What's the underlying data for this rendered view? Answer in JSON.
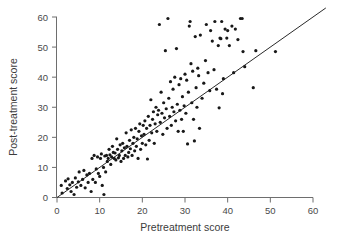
{
  "chart_data": {
    "type": "scatter",
    "title": "",
    "xlabel": "Pretreatment score",
    "ylabel": "Post-treatment score",
    "xlim": [
      0,
      60
    ],
    "ylim": [
      0,
      60
    ],
    "xticks": [
      0,
      10,
      20,
      30,
      40,
      50,
      60
    ],
    "yticks": [
      0,
      10,
      20,
      30,
      40,
      50,
      60
    ],
    "xtick_labels": [
      "0",
      "10",
      "20",
      "30",
      "40",
      "50",
      "60"
    ],
    "ytick_labels": [
      "0",
      "10",
      "20",
      "30",
      "40",
      "50",
      "60"
    ],
    "grid": false,
    "legend": null,
    "marker": "dot",
    "marker_color": "#181818",
    "marker_size": 1.6,
    "reference_line": {
      "name": "identity-line",
      "type": "line",
      "description": "y = x line of no change",
      "slope": 1,
      "intercept": 0,
      "x_start": 0,
      "y_start": 0,
      "x_end": 63,
      "y_end": 63,
      "color": "#2a2a2a"
    },
    "n_points": 176,
    "points": [
      [
        1.0,
        4.0
      ],
      [
        1.2,
        1.5
      ],
      [
        2.0,
        5.5
      ],
      [
        2.4,
        3.0
      ],
      [
        2.6,
        6.2
      ],
      [
        3.0,
        4.2
      ],
      [
        3.3,
        2.0
      ],
      [
        3.6,
        5.0
      ],
      [
        4.0,
        1.0
      ],
      [
        4.3,
        6.5
      ],
      [
        4.6,
        3.4
      ],
      [
        5.0,
        5.2
      ],
      [
        5.2,
        8.5
      ],
      [
        5.6,
        4.0
      ],
      [
        6.0,
        6.0
      ],
      [
        6.3,
        9.0
      ],
      [
        6.6,
        3.2
      ],
      [
        7.0,
        7.5
      ],
      [
        7.3,
        5.0
      ],
      [
        7.6,
        8.0
      ],
      [
        8.0,
        2.0
      ],
      [
        8.2,
        13.0
      ],
      [
        8.4,
        6.0
      ],
      [
        8.7,
        14.0
      ],
      [
        9.0,
        5.0
      ],
      [
        9.2,
        9.5
      ],
      [
        9.5,
        13.5
      ],
      [
        9.7,
        8.0
      ],
      [
        10.0,
        7.0
      ],
      [
        10.2,
        13.0
      ],
      [
        10.4,
        14.5
      ],
      [
        10.6,
        4.0
      ],
      [
        10.9,
        10.0
      ],
      [
        11.0,
        1.0
      ],
      [
        11.2,
        13.8
      ],
      [
        11.4,
        8.5
      ],
      [
        11.6,
        14.0
      ],
      [
        11.8,
        12.0
      ],
      [
        12.0,
        13.0
      ],
      [
        12.2,
        16.0
      ],
      [
        12.4,
        14.2
      ],
      [
        12.6,
        11.0
      ],
      [
        12.8,
        13.5
      ],
      [
        13.0,
        17.0
      ],
      [
        13.2,
        15.0
      ],
      [
        13.4,
        13.0
      ],
      [
        13.6,
        14.8
      ],
      [
        13.8,
        12.5
      ],
      [
        14.0,
        19.5
      ],
      [
        14.2,
        16.0
      ],
      [
        14.4,
        13.2
      ],
      [
        14.6,
        14.0
      ],
      [
        14.8,
        17.5
      ],
      [
        15.0,
        12.0
      ],
      [
        15.2,
        15.5
      ],
      [
        15.4,
        18.0
      ],
      [
        15.6,
        13.0
      ],
      [
        15.8,
        16.5
      ],
      [
        16.0,
        14.0
      ],
      [
        16.2,
        21.5
      ],
      [
        16.4,
        17.0
      ],
      [
        16.6,
        13.5
      ],
      [
        16.8,
        15.0
      ],
      [
        17.0,
        19.0
      ],
      [
        17.2,
        16.2
      ],
      [
        17.4,
        22.5
      ],
      [
        17.6,
        14.0
      ],
      [
        17.8,
        18.0
      ],
      [
        18.0,
        20.0
      ],
      [
        18.2,
        15.5
      ],
      [
        18.4,
        23.0
      ],
      [
        18.6,
        17.0
      ],
      [
        18.8,
        19.5
      ],
      [
        19.0,
        13.0
      ],
      [
        19.2,
        22.0
      ],
      [
        19.4,
        24.5
      ],
      [
        19.6,
        16.0
      ],
      [
        19.8,
        20.5
      ],
      [
        20.0,
        18.0
      ],
      [
        20.2,
        24.0
      ],
      [
        20.4,
        21.0
      ],
      [
        20.6,
        25.5
      ],
      [
        20.8,
        17.5
      ],
      [
        21.0,
        23.0
      ],
      [
        21.2,
        12.8
      ],
      [
        21.4,
        27.0
      ],
      [
        21.6,
        19.0
      ],
      [
        21.8,
        24.0
      ],
      [
        22.0,
        32.5
      ],
      [
        22.2,
        21.5
      ],
      [
        22.4,
        26.0
      ],
      [
        22.6,
        28.5
      ],
      [
        22.8,
        18.0
      ],
      [
        23.0,
        24.5
      ],
      [
        23.2,
        30.0
      ],
      [
        23.4,
        22.0
      ],
      [
        23.6,
        27.5
      ],
      [
        23.8,
        29.0
      ],
      [
        24.0,
        57.5
      ],
      [
        24.2,
        25.0
      ],
      [
        24.4,
        35.0
      ],
      [
        24.6,
        28.0
      ],
      [
        24.8,
        21.0
      ],
      [
        25.0,
        31.5
      ],
      [
        25.2,
        26.5
      ],
      [
        25.4,
        48.8
      ],
      [
        25.6,
        29.5
      ],
      [
        25.8,
        23.0
      ],
      [
        26.0,
        59.5
      ],
      [
        26.2,
        33.0
      ],
      [
        26.4,
        27.0
      ],
      [
        26.6,
        38.5
      ],
      [
        26.8,
        24.0
      ],
      [
        27.0,
        30.0
      ],
      [
        27.2,
        36.0
      ],
      [
        27.4,
        28.5
      ],
      [
        27.6,
        40.0
      ],
      [
        27.8,
        25.5
      ],
      [
        28.0,
        49.5
      ],
      [
        28.2,
        31.0
      ],
      [
        28.4,
        22.0
      ],
      [
        28.6,
        37.5
      ],
      [
        28.8,
        29.0
      ],
      [
        29.0,
        39.5
      ],
      [
        29.2,
        26.0
      ],
      [
        29.4,
        33.5
      ],
      [
        29.6,
        22.0
      ],
      [
        29.8,
        30.5
      ],
      [
        30.0,
        41.0
      ],
      [
        30.2,
        28.0
      ],
      [
        30.4,
        39.0
      ],
      [
        30.6,
        17.8
      ],
      [
        30.8,
        35.0
      ],
      [
        31.0,
        57.0
      ],
      [
        31.2,
        58.5
      ],
      [
        31.4,
        44.5
      ],
      [
        31.6,
        31.5
      ],
      [
        31.8,
        42.0
      ],
      [
        32.0,
        26.0
      ],
      [
        32.2,
        18.8
      ],
      [
        32.4,
        53.5
      ],
      [
        32.6,
        36.5
      ],
      [
        32.8,
        30.0
      ],
      [
        33.0,
        43.0
      ],
      [
        33.2,
        40.5
      ],
      [
        33.4,
        23.0
      ],
      [
        33.6,
        54.0
      ],
      [
        34.0,
        33.0
      ],
      [
        34.4,
        38.0
      ],
      [
        34.8,
        45.5
      ],
      [
        35.0,
        57.5
      ],
      [
        35.4,
        41.5
      ],
      [
        35.8,
        35.5
      ],
      [
        36.0,
        55.5
      ],
      [
        36.4,
        52.0
      ],
      [
        36.8,
        42.5
      ],
      [
        37.0,
        58.5
      ],
      [
        37.4,
        36.0
      ],
      [
        37.8,
        50.5
      ],
      [
        38.0,
        29.8
      ],
      [
        38.2,
        53.0
      ],
      [
        38.4,
        52.8
      ],
      [
        38.6,
        58.5
      ],
      [
        38.8,
        34.5
      ],
      [
        39.0,
        39.5
      ],
      [
        39.4,
        56.0
      ],
      [
        39.8,
        53.0
      ],
      [
        40.0,
        55.5
      ],
      [
        40.4,
        50.5
      ],
      [
        41.0,
        57.0
      ],
      [
        41.4,
        41.5
      ],
      [
        41.8,
        56.0
      ],
      [
        42.4,
        52.5
      ],
      [
        43.0,
        59.5
      ],
      [
        43.4,
        59.5
      ],
      [
        43.6,
        48.5
      ],
      [
        44.0,
        43.5
      ],
      [
        46.0,
        36.5
      ],
      [
        46.6,
        48.8
      ],
      [
        51.2,
        48.5
      ]
    ]
  },
  "axes": {
    "x_axis_name": "x-axis",
    "y_axis_name": "y-axis"
  }
}
